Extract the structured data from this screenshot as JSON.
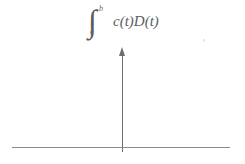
{
  "figure": {
    "name": "impulse-with-integral-label",
    "background_color": "#ffffff",
    "ink_color": "#5d5d5f",
    "axis_color": "#8a8a8c",
    "arrow_color": "#6e6e70"
  },
  "formula": {
    "integral_symbol": "∫",
    "upper_limit": "b",
    "lower_limit": "a",
    "integrand": "c(t)D(t)",
    "full_text": "∫_a^b c(t)D(t)"
  },
  "arrow": {
    "label": "impulse-arrow",
    "direction": "up",
    "base_x": 122,
    "tip_y": 47,
    "base_y": 152
  },
  "axis": {
    "label": "horizontal-axis",
    "x_start": 12,
    "x_end": 230,
    "y": 147
  }
}
